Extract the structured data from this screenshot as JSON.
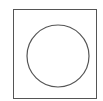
{
  "diagram": {
    "shapes": [
      {
        "type": "square",
        "x": 13.5,
        "y": 9.5,
        "width": 83,
        "height": 89,
        "stroke": "#555555"
      },
      {
        "type": "circle",
        "cx": 58,
        "cy": 56,
        "r": 31,
        "stroke": "#555555"
      }
    ],
    "background": "#ffffff"
  }
}
